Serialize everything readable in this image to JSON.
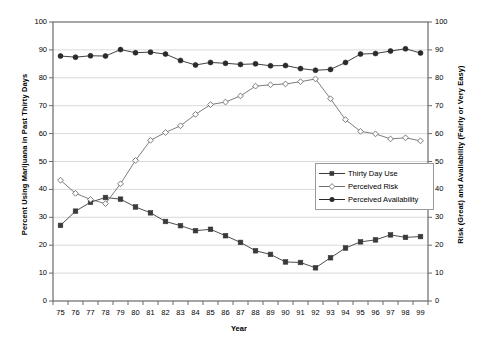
{
  "chart_data": {
    "type": "line",
    "title": "",
    "xlabel": "Year",
    "ylabel": "Percent Using Marijuana in Past Thirty Days",
    "ylabel_right": "Risk (Great) and Availability (Fairly or Very Easy)",
    "categories": [
      "75",
      "76",
      "77",
      "78",
      "79",
      "80",
      "81",
      "82",
      "83",
      "84",
      "85",
      "86",
      "87",
      "88",
      "89",
      "90",
      "91",
      "92",
      "93",
      "94",
      "95",
      "96",
      "97",
      "98",
      "99"
    ],
    "ylim": [
      0,
      100
    ],
    "yticks": [
      0,
      10,
      20,
      30,
      40,
      50,
      60,
      70,
      80,
      90,
      100
    ],
    "ylim_right": [
      0,
      100
    ],
    "yticks_right": [
      0,
      10,
      20,
      30,
      40,
      50,
      60,
      70,
      80,
      90,
      100
    ],
    "grid": true,
    "legend_position": "inside-right",
    "series": [
      {
        "name": "Thirty Day Use",
        "marker": "filled-square",
        "color": "#3a3a3a",
        "values": [
          27.1,
          32.2,
          35.4,
          37.1,
          36.5,
          33.7,
          31.6,
          28.5,
          27.0,
          25.2,
          25.7,
          23.4,
          21.0,
          18.0,
          16.7,
          14.0,
          13.8,
          11.9,
          15.5,
          19.0,
          21.2,
          21.9,
          23.7,
          22.8,
          23.1
        ]
      },
      {
        "name": "Perceived Risk",
        "marker": "open-diamond",
        "color": "#6e6e6e",
        "values": [
          43.3,
          38.6,
          36.4,
          34.9,
          42.0,
          50.4,
          57.6,
          60.4,
          62.8,
          66.9,
          70.4,
          71.3,
          73.5,
          77.0,
          77.5,
          77.8,
          78.6,
          79.6,
          72.5,
          65.0,
          60.8,
          59.9,
          58.1,
          58.5,
          57.4
        ]
      },
      {
        "name": "Perceived Availability",
        "marker": "filled-circle",
        "color": "#2a2a2a",
        "values": [
          87.8,
          87.4,
          87.9,
          87.8,
          90.1,
          89.0,
          89.2,
          88.5,
          86.2,
          84.6,
          85.5,
          85.2,
          84.8,
          85.0,
          84.3,
          84.4,
          83.3,
          82.7,
          83.0,
          85.5,
          88.5,
          88.7,
          89.6,
          90.4,
          88.9
        ]
      }
    ]
  },
  "legend": {
    "items": [
      {
        "label": "Thirty Day Use"
      },
      {
        "label": "Perceived Risk"
      },
      {
        "label": "Perceived Availability"
      }
    ]
  }
}
